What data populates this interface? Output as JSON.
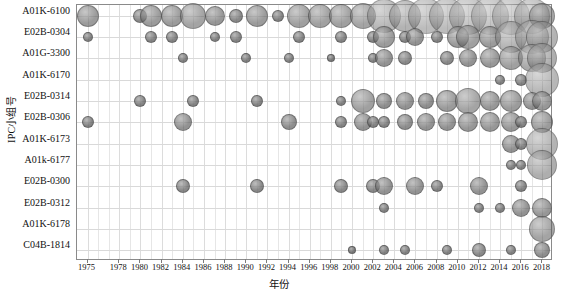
{
  "chart_data": {
    "type": "scatter",
    "title": "",
    "xlabel": "年份",
    "ylabel": "IPC小组号",
    "grid": true,
    "legend": "none",
    "x_tick_labels": [
      "1975",
      "1978",
      "1980",
      "1982",
      "1984",
      "1986",
      "1988",
      "1990",
      "1992",
      "1994",
      "1996",
      "1998",
      "2000",
      "2002",
      "2004",
      "2006",
      "2008",
      "2010",
      "2012",
      "2014",
      "2016",
      "2018"
    ],
    "y_categories": [
      "A01K-6100",
      "E02B-0304",
      "A01G-3300",
      "A01K-6170",
      "E02B-0314",
      "E02B-0306",
      "A01K-6173",
      "A01k-6177",
      "E02B-0300",
      "E02B-0312",
      "A01K-6178",
      "C04B-1814"
    ],
    "xlim": [
      1974,
      2019
    ],
    "size_units": "patent count (bubble area)",
    "series": [
      {
        "name": "A01K-6100",
        "points": [
          {
            "x": 1975,
            "size": 11
          },
          {
            "x": 1980,
            "size": 7
          },
          {
            "x": 1981,
            "size": 11
          },
          {
            "x": 1983,
            "size": 11
          },
          {
            "x": 1985,
            "size": 13
          },
          {
            "x": 1987,
            "size": 10
          },
          {
            "x": 1989,
            "size": 7
          },
          {
            "x": 1991,
            "size": 11
          },
          {
            "x": 1993,
            "size": 6
          },
          {
            "x": 1995,
            "size": 12
          },
          {
            "x": 1997,
            "size": 12
          },
          {
            "x": 1999,
            "size": 12
          },
          {
            "x": 2001,
            "size": 13
          },
          {
            "x": 2003,
            "size": 17
          },
          {
            "x": 2005,
            "size": 16
          },
          {
            "x": 2007,
            "size": 18
          },
          {
            "x": 2009,
            "size": 18
          },
          {
            "x": 2011,
            "size": 19
          },
          {
            "x": 2013,
            "size": 19
          },
          {
            "x": 2015,
            "size": 19
          },
          {
            "x": 2017,
            "size": 18
          },
          {
            "x": 2018,
            "size": 13
          }
        ]
      },
      {
        "name": "E02B-0304",
        "points": [
          {
            "x": 1975,
            "size": 5
          },
          {
            "x": 1981,
            "size": 6
          },
          {
            "x": 1983,
            "size": 6
          },
          {
            "x": 1987,
            "size": 5
          },
          {
            "x": 1989,
            "size": 6
          },
          {
            "x": 1995,
            "size": 6
          },
          {
            "x": 1999,
            "size": 6
          },
          {
            "x": 2002,
            "size": 6
          },
          {
            "x": 2003,
            "size": 11
          },
          {
            "x": 2005,
            "size": 6
          },
          {
            "x": 2006,
            "size": 9
          },
          {
            "x": 2008,
            "size": 6
          },
          {
            "x": 2010,
            "size": 11
          },
          {
            "x": 2011,
            "size": 12
          },
          {
            "x": 2013,
            "size": 11
          },
          {
            "x": 2015,
            "size": 16
          },
          {
            "x": 2017,
            "size": 17
          },
          {
            "x": 2018,
            "size": 16
          }
        ]
      },
      {
        "name": "A01G-3300",
        "points": [
          {
            "x": 1984,
            "size": 5
          },
          {
            "x": 1990,
            "size": 5
          },
          {
            "x": 1994,
            "size": 5
          },
          {
            "x": 1998,
            "size": 4
          },
          {
            "x": 2002,
            "size": 5
          },
          {
            "x": 2003,
            "size": 9
          },
          {
            "x": 2005,
            "size": 7
          },
          {
            "x": 2009,
            "size": 7
          },
          {
            "x": 2011,
            "size": 9
          },
          {
            "x": 2013,
            "size": 10
          },
          {
            "x": 2015,
            "size": 12
          },
          {
            "x": 2017,
            "size": 14
          },
          {
            "x": 2018,
            "size": 15
          }
        ]
      },
      {
        "name": "A01K-6170",
        "points": [
          {
            "x": 2014,
            "size": 5
          },
          {
            "x": 2016,
            "size": 6
          },
          {
            "x": 2018,
            "size": 17
          }
        ]
      },
      {
        "name": "E02B-0314",
        "points": [
          {
            "x": 1980,
            "size": 6
          },
          {
            "x": 1985,
            "size": 6
          },
          {
            "x": 1991,
            "size": 6
          },
          {
            "x": 1999,
            "size": 5
          },
          {
            "x": 2001,
            "size": 12
          },
          {
            "x": 2003,
            "size": 8
          },
          {
            "x": 2005,
            "size": 9
          },
          {
            "x": 2007,
            "size": 8
          },
          {
            "x": 2009,
            "size": 11
          },
          {
            "x": 2011,
            "size": 13
          },
          {
            "x": 2013,
            "size": 10
          },
          {
            "x": 2015,
            "size": 11
          },
          {
            "x": 2017,
            "size": 9
          },
          {
            "x": 2018,
            "size": 10
          }
        ]
      },
      {
        "name": "E02B-0306",
        "points": [
          {
            "x": 1975,
            "size": 6
          },
          {
            "x": 1984,
            "size": 9
          },
          {
            "x": 1994,
            "size": 8
          },
          {
            "x": 1999,
            "size": 6
          },
          {
            "x": 2001,
            "size": 9
          },
          {
            "x": 2002,
            "size": 6
          },
          {
            "x": 2003,
            "size": 6
          },
          {
            "x": 2005,
            "size": 8
          },
          {
            "x": 2007,
            "size": 9
          },
          {
            "x": 2009,
            "size": 9
          },
          {
            "x": 2011,
            "size": 10
          },
          {
            "x": 2013,
            "size": 10
          },
          {
            "x": 2015,
            "size": 10
          },
          {
            "x": 2016,
            "size": 6
          },
          {
            "x": 2018,
            "size": 11
          }
        ]
      },
      {
        "name": "A01K-6173",
        "points": [
          {
            "x": 2015,
            "size": 9
          },
          {
            "x": 2016,
            "size": 6
          },
          {
            "x": 2018,
            "size": 16
          }
        ]
      },
      {
        "name": "A01k-6177",
        "points": [
          {
            "x": 2015,
            "size": 5
          },
          {
            "x": 2016,
            "size": 5
          },
          {
            "x": 2018,
            "size": 15
          }
        ]
      },
      {
        "name": "E02B-0300",
        "points": [
          {
            "x": 1984,
            "size": 7
          },
          {
            "x": 1991,
            "size": 7
          },
          {
            "x": 1999,
            "size": 7
          },
          {
            "x": 2002,
            "size": 7
          },
          {
            "x": 2003,
            "size": 9
          },
          {
            "x": 2006,
            "size": 9
          },
          {
            "x": 2008,
            "size": 6
          },
          {
            "x": 2012,
            "size": 9
          },
          {
            "x": 2016,
            "size": 6
          }
        ]
      },
      {
        "name": "E02B-0312",
        "points": [
          {
            "x": 2003,
            "size": 5
          },
          {
            "x": 2012,
            "size": 5
          },
          {
            "x": 2014,
            "size": 5
          },
          {
            "x": 2016,
            "size": 9
          },
          {
            "x": 2018,
            "size": 10
          }
        ]
      },
      {
        "name": "A01K-6178",
        "points": [
          {
            "x": 2018,
            "size": 13
          }
        ]
      },
      {
        "name": "C04B-1814",
        "points": [
          {
            "x": 2000,
            "size": 4
          },
          {
            "x": 2003,
            "size": 5
          },
          {
            "x": 2005,
            "size": 5
          },
          {
            "x": 2009,
            "size": 5
          },
          {
            "x": 2012,
            "size": 7
          },
          {
            "x": 2015,
            "size": 5
          },
          {
            "x": 2018,
            "size": 8
          }
        ]
      }
    ]
  }
}
